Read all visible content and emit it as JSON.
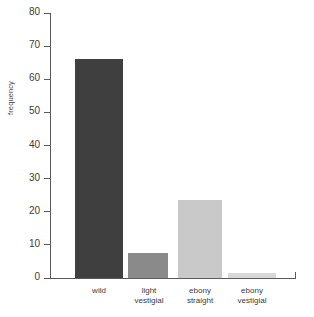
{
  "chart_data": {
    "type": "bar",
    "title": "",
    "xlabel": "",
    "ylabel": "frequency",
    "categories": [
      "wild",
      "light vestigial",
      "ebony straight",
      "ebony vestigial"
    ],
    "values": [
      66,
      7.5,
      23.5,
      1.5
    ],
    "bar_colors": [
      "#3f3f3f",
      "#8a8a8a",
      "#c9c9c9",
      "#d8d8d8"
    ],
    "ylim": [
      0,
      80
    ],
    "yticks": [
      0,
      10,
      20,
      30,
      40,
      50,
      60,
      70,
      80
    ],
    "ytick_labels": [
      "0",
      "10",
      "20",
      "30",
      "40",
      "50",
      "60",
      "70",
      "80"
    ],
    "grid": false,
    "legend": null,
    "category_lines": [
      [
        "wild"
      ],
      [
        "light",
        "vestigial"
      ],
      [
        "ebony",
        "straight"
      ],
      [
        "ebony",
        "vestigial"
      ]
    ]
  },
  "axis": {
    "y_label": "frequency"
  }
}
